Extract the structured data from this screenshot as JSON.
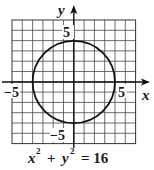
{
  "chart_data": {
    "type": "line",
    "caption": {
      "base_x": "x",
      "sup_x": "2",
      "plus": "+",
      "base_y": "y",
      "sup_y": "2",
      "rhs": "= 16"
    },
    "xlabel": "x",
    "ylabel": "y",
    "xlim": [
      -6,
      6
    ],
    "ylim": [
      -6,
      6
    ],
    "grid": true,
    "grid_step": 1,
    "tick_labels": {
      "x_neg": "−5",
      "x_pos": "5",
      "y_pos": "5",
      "y_neg": "−5"
    },
    "series": [
      {
        "name": "circle",
        "shape": "circle",
        "center": [
          0,
          0
        ],
        "radius": 4,
        "color": "#111111"
      }
    ]
  }
}
